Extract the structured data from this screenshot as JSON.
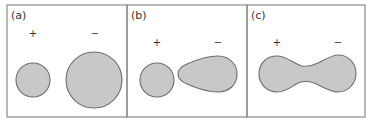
{
  "figure": {
    "colors": {
      "fill": "#c8c8c8",
      "stroke": "#6e6e6e",
      "frame": "#8a8a8a",
      "text": "#333333"
    },
    "panels": [
      {
        "label": "(a)",
        "description": "Two separate droplets: small positive, large negative",
        "plus_label": "+",
        "minus_label": "−"
      },
      {
        "label": "(b)",
        "description": "Equal small droplet (positive) beside teardrop-shaped droplet (negative) pointing toward it",
        "plus_label": "+",
        "minus_label": "−"
      },
      {
        "label": "(c)",
        "description": "Droplets coalesced into a single dumbbell shape with a narrow neck",
        "plus_label": "+",
        "minus_label": "−"
      }
    ]
  }
}
